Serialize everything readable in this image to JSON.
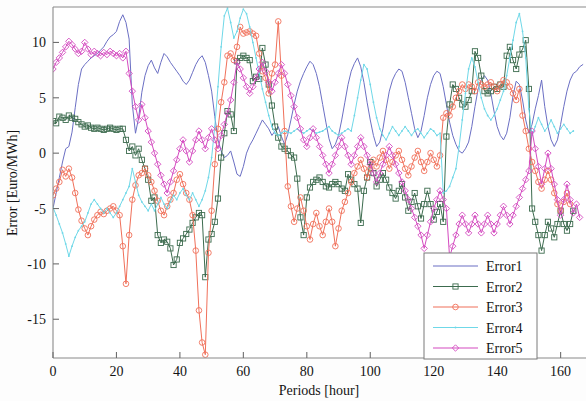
{
  "chart_data": {
    "type": "line",
    "title": "",
    "xlabel": "Periods [hour]",
    "ylabel": "Error [Euro/MWh]",
    "xlim": [
      0,
      168
    ],
    "ylim": [
      -18.5,
      13.2
    ],
    "xticks": [
      0,
      20,
      40,
      60,
      80,
      100,
      120,
      140,
      160
    ],
    "yticks": [
      10,
      5,
      0,
      -5,
      -10,
      -15
    ],
    "xtick_labels": [
      "0",
      "20",
      "40",
      "60",
      "80",
      "100",
      "120",
      "140",
      "160"
    ],
    "ytick_labels": [
      "10",
      "5",
      "0",
      "-5",
      "-10",
      "-15"
    ],
    "grid": false,
    "legend_position": "lower right",
    "legend_entries": [
      "Error1",
      "Error2",
      "Error3",
      "Error4",
      "Error5"
    ],
    "series": [
      {
        "name": "Error1",
        "color": "#6b6fc4",
        "marker": "none",
        "linewidth": 1.0,
        "values": [
          -5.0,
          -3.6,
          -2.2,
          -0.8,
          0.4,
          0.6,
          1.9,
          4.1,
          6.2,
          7.6,
          8.0,
          8.3,
          8.6,
          8.8,
          9.0,
          9.3,
          9.6,
          10.1,
          10.5,
          10.7,
          11.0,
          11.9,
          12.5,
          11.8,
          10.3,
          4.4,
          1.8,
          3.2,
          5.5,
          7.0,
          7.9,
          8.4,
          7.7,
          7.2,
          8.2,
          9.0,
          8.7,
          8.2,
          7.8,
          7.4,
          7.0,
          6.5,
          6.2,
          6.6,
          7.3,
          8.0,
          8.5,
          8.8,
          8.2,
          7.0,
          5.6,
          3.3,
          1.2,
          0.2,
          -0.4,
          -0.2,
          0.2,
          -0.8,
          -1.9,
          -2.1,
          -1.2,
          0.0,
          0.7,
          1.2,
          1.8,
          2.4,
          3.0,
          2.6,
          2.2,
          1.6,
          2.0,
          2.4,
          1.5,
          0.8,
          1.7,
          3.0,
          4.4,
          5.6,
          6.5,
          7.2,
          7.8,
          8.3,
          8.0,
          7.2,
          6.0,
          4.4,
          2.8,
          1.3,
          0.4,
          0.8,
          1.6,
          3.0,
          4.6,
          6.2,
          7.4,
          8.1,
          8.6,
          7.8,
          6.4,
          4.6,
          3.0,
          1.6,
          0.6,
          1.0,
          2.2,
          4.0,
          5.6,
          6.6,
          7.2,
          7.6,
          7.4,
          6.4,
          5.0,
          3.6,
          2.2,
          1.4,
          2.0,
          3.4,
          5.0,
          6.2,
          7.0,
          7.4,
          7.2,
          6.0,
          4.4,
          2.8,
          1.6,
          0.8,
          0.2,
          0.0,
          0.4,
          1.0,
          2.4,
          4.2,
          5.8,
          6.6,
          7.0,
          6.6,
          5.4,
          3.8,
          2.4,
          1.6,
          1.2,
          1.8,
          3.2,
          5.2,
          6.5,
          6.2,
          4.8,
          3.0,
          1.8,
          2.6,
          4.0,
          5.2,
          6.6,
          4.2,
          2.4,
          1.2,
          0.6,
          1.2,
          2.6,
          4.2,
          5.6,
          6.6,
          7.2,
          7.4,
          7.8,
          8.0
        ]
      },
      {
        "name": "Error2",
        "color": "#3c6b4e",
        "marker": "square",
        "linewidth": 1.0,
        "values": [
          2.9,
          2.7,
          3.3,
          3.2,
          3.0,
          3.4,
          3.2,
          3.1,
          2.8,
          2.6,
          2.4,
          2.5,
          2.3,
          2.2,
          2.3,
          2.2,
          2.1,
          2.2,
          2.3,
          2.2,
          2.1,
          2.2,
          2.2,
          1.2,
          0.2,
          0.6,
          -0.2,
          0.4,
          -0.6,
          -1.4,
          -2.4,
          -4.3,
          -4.0,
          -7.4,
          -8.1,
          -7.8,
          -8.0,
          -8.6,
          -10.1,
          -9.6,
          -8.1,
          -7.7,
          -7.3,
          -6.9,
          -6.3,
          -5.8,
          -5.4,
          -5.6,
          -11.2,
          -7.8,
          -7.3,
          -6.2,
          -4.1,
          -0.4,
          1.8,
          3.8,
          3.5,
          2.0,
          8.3,
          8.6,
          8.8,
          8.6,
          8.4,
          6.5,
          6.9,
          6.7,
          9.5,
          8.0,
          6.2,
          4.3,
          2.4,
          1.4,
          0.6,
          0.4,
          0.2,
          -0.2,
          -0.4,
          -2.3,
          -5.8,
          -7.4,
          -4.0,
          -3.1,
          -2.6,
          -2.4,
          -2.2,
          -2.6,
          -3.0,
          -3.1,
          -2.8,
          -2.6,
          -2.8,
          -3.2,
          -3.4,
          -1.9,
          -2.4,
          -2.8,
          -3.2,
          -6.3,
          -3.4,
          -2.2,
          -0.8,
          -1.8,
          -3.0,
          -2.4,
          -1.8,
          -2.4,
          -3.1,
          -3.6,
          -4.1,
          -3.4,
          -2.8,
          -4.0,
          -5.2,
          -4.4,
          -3.6,
          -4.8,
          -5.9,
          -4.6,
          -3.4,
          -4.6,
          -6.0,
          -5.3,
          -4.6,
          -6.2,
          1.5,
          4.4,
          6.2,
          5.8,
          5.0,
          4.4,
          4.2,
          4.8,
          5.6,
          9.2,
          8.6,
          7.0,
          5.6,
          5.4,
          5.6,
          6.0,
          5.8,
          6.2,
          6.0,
          8.8,
          9.6,
          8.4,
          7.6,
          8.9,
          9.4,
          10.2,
          5.8,
          -5.0,
          -6.2,
          -7.4,
          -8.8,
          -7.4,
          -6.2,
          -6.8,
          -7.6,
          -6.4,
          -5.2,
          -6.4,
          -7.0,
          -6.4,
          -5.2
        ]
      },
      {
        "name": "Error3",
        "color": "#f0705a",
        "marker": "circle",
        "linewidth": 1.0,
        "values": [
          -3.8,
          -3.2,
          -2.6,
          -1.5,
          -2.1,
          -1.4,
          -2.2,
          -3.6,
          -5.1,
          -6.1,
          -6.8,
          -7.4,
          -6.6,
          -6.0,
          -5.6,
          -5.3,
          -5.5,
          -5.2,
          -5.0,
          -4.8,
          -5.2,
          -5.6,
          -8.4,
          -11.8,
          -7.4,
          -4.2,
          -2.9,
          -2.0,
          -1.8,
          -1.4,
          -2.0,
          -2.6,
          -3.4,
          -4.3,
          -5.2,
          -5.6,
          -4.8,
          -4.2,
          -3.6,
          -2.4,
          -1.9,
          -2.8,
          -3.6,
          -4.2,
          -5.6,
          -8.8,
          -14.2,
          -17.1,
          -18.2,
          -9.0,
          -5.2,
          -1.0,
          2.2,
          4.6,
          6.4,
          8.8,
          9.0,
          8.4,
          9.6,
          11.4,
          10.8,
          10.9,
          11.0,
          10.8,
          10.6,
          9.0,
          7.4,
          6.8,
          5.4,
          7.2,
          8.0,
          11.9,
          7.0,
          2.0,
          -3.0,
          -4.8,
          -6.2,
          -5.0,
          -4.0,
          -5.2,
          -6.6,
          -7.8,
          -6.4,
          -5.4,
          -6.6,
          -7.4,
          -6.2,
          -5.0,
          -6.2,
          -8.4,
          -6.8,
          -5.2,
          -4.4,
          -3.6,
          -2.6,
          -1.8,
          -1.2,
          -0.6,
          -1.4,
          -2.2,
          -1.4,
          -0.6,
          -1.2,
          -0.4,
          0.2,
          -0.6,
          -1.4,
          -0.8,
          -0.2,
          0.2,
          -0.6,
          -1.4,
          -2.0,
          -1.2,
          -0.4,
          0.2,
          -0.8,
          -1.6,
          -0.8,
          0.0,
          -0.6,
          -1.2,
          -0.2,
          3.2,
          3.6,
          3.4,
          4.2,
          5.0,
          5.6,
          6.2,
          5.8,
          6.2,
          6.0,
          5.6,
          6.4,
          6.2,
          6.0,
          6.2,
          6.4,
          6.0,
          5.6,
          6.2,
          6.6,
          6.4,
          6.0,
          5.4,
          4.8,
          5.8,
          3.4,
          2.0,
          0.4,
          -0.8,
          -1.6,
          -2.6,
          -3.2,
          -2.4,
          -1.6,
          -2.4,
          -3.6,
          -4.6,
          -5.2,
          -4.4,
          -3.6,
          -4.6
        ]
      },
      {
        "name": "Error4",
        "color": "#6fd8e8",
        "marker": "dot",
        "linewidth": 1.0,
        "values": [
          -4.9,
          -5.6,
          -6.4,
          -7.2,
          -8.2,
          -9.3,
          -8.4,
          -7.6,
          -7.0,
          -6.6,
          -6.2,
          -5.4,
          -4.6,
          -4.2,
          -4.6,
          -5.0,
          -5.4,
          -5.0,
          -5.4,
          -5.8,
          -5.4,
          -4.8,
          -4.2,
          -3.6,
          -3.0,
          -1.4,
          -2.6,
          -3.8,
          -4.4,
          -4.8,
          -5.2,
          -4.6,
          -5.2,
          -4.6,
          -4.0,
          -4.6,
          -5.0,
          -4.4,
          -3.8,
          -4.2,
          -3.6,
          -3.2,
          -3.8,
          -4.2,
          -3.6,
          -4.2,
          -4.8,
          -4.2,
          -3.4,
          -2.2,
          -0.4,
          2.4,
          6.0,
          9.6,
          12.4,
          13.1,
          11.8,
          10.4,
          11.0,
          12.2,
          13.0,
          12.6,
          11.4,
          10.0,
          8.6,
          7.2,
          5.8,
          4.6,
          3.4,
          2.4,
          1.8,
          1.6,
          1.8,
          2.0,
          1.9,
          1.8,
          2.0,
          2.2,
          2.0,
          1.8,
          2.0,
          2.2,
          2.0,
          1.8,
          1.9,
          2.0,
          2.2,
          2.4,
          2.0,
          1.8,
          1.6,
          1.8,
          2.0,
          2.2,
          2.0,
          3.4,
          5.0,
          6.6,
          8.0,
          7.6,
          6.2,
          4.6,
          3.2,
          2.2,
          1.6,
          1.2,
          1.8,
          2.4,
          2.0,
          1.6,
          2.0,
          2.4,
          2.0,
          1.6,
          2.0,
          2.2,
          1.8,
          1.4,
          1.8,
          2.2,
          2.0,
          1.6,
          1.8,
          -3.6,
          -3.4,
          -3.0,
          -2.2,
          -1.4,
          0.6,
          3.0,
          5.4,
          7.6,
          8.6,
          7.8,
          6.4,
          5.0,
          4.0,
          3.4,
          3.0,
          3.4,
          4.0,
          4.8,
          5.6,
          7.0,
          8.6,
          10.2,
          11.8,
          12.6,
          11.0,
          8.6,
          4.0,
          1.6,
          2.4,
          3.2,
          2.6,
          2.0,
          2.4,
          3.0,
          2.4,
          1.8,
          2.2,
          2.6,
          2.2,
          1.8,
          2.0
        ]
      },
      {
        "name": "Error5",
        "color": "#d44ac0",
        "marker": "diamond",
        "linewidth": 1.0,
        "values": [
          7.6,
          8.2,
          8.6,
          9.1,
          9.6,
          10.1,
          9.8,
          9.4,
          9.0,
          9.2,
          10.0,
          9.4,
          8.9,
          9.2,
          9.0,
          8.8,
          9.1,
          8.9,
          9.2,
          9.0,
          8.8,
          9.0,
          8.6,
          9.2,
          7.2,
          5.6,
          4.2,
          3.0,
          4.4,
          3.2,
          2.0,
          1.0,
          0.0,
          -1.0,
          -2.0,
          -2.8,
          -3.6,
          -2.6,
          -1.6,
          -0.6,
          0.4,
          1.2,
          0.2,
          -0.8,
          0.2,
          1.2,
          2.0,
          1.2,
          0.4,
          1.4,
          2.2,
          1.2,
          0.4,
          1.6,
          2.6,
          3.6,
          4.8,
          6.4,
          8.2,
          7.6,
          6.8,
          6.0,
          5.4,
          6.0,
          6.8,
          7.6,
          8.2,
          7.4,
          6.4,
          5.6,
          6.4,
          7.2,
          8.0,
          7.2,
          6.2,
          5.2,
          4.2,
          3.2,
          2.2,
          1.2,
          0.6,
          1.4,
          2.2,
          1.4,
          0.6,
          -0.2,
          -1.0,
          -1.8,
          -1.0,
          -0.2,
          0.6,
          1.4,
          0.6,
          -0.2,
          -1.0,
          -0.2,
          0.6,
          1.4,
          0.6,
          -0.2,
          -1.0,
          -1.8,
          -2.6,
          -1.8,
          -1.0,
          -0.2,
          0.6,
          -0.2,
          -1.0,
          -1.8,
          -2.6,
          -3.4,
          -4.2,
          -5.0,
          -5.8,
          -6.6,
          -7.4,
          -8.6,
          -7.4,
          -6.2,
          -5.0,
          -4.2,
          -3.4,
          -4.2,
          -5.0,
          -9.4,
          -8.4,
          -7.4,
          -6.4,
          -5.6,
          -6.4,
          -7.2,
          -6.4,
          -5.6,
          -6.4,
          -7.2,
          -6.4,
          -5.6,
          -6.4,
          -7.2,
          -6.4,
          -5.6,
          -4.8,
          -5.6,
          -6.4,
          -5.6,
          -4.8,
          -4.0,
          -3.2,
          -2.4,
          -1.6,
          2.0,
          0.4,
          -1.2,
          -2.8,
          -1.4,
          0.0,
          -1.4,
          -2.8,
          -4.2,
          -5.6,
          -4.2,
          -2.8,
          -4.2,
          -5.4,
          -4.6,
          -5.8
        ]
      }
    ]
  },
  "axes": {
    "ylabel": "Error [Euro/MWh]",
    "xlabel": "Periods [hour]"
  }
}
